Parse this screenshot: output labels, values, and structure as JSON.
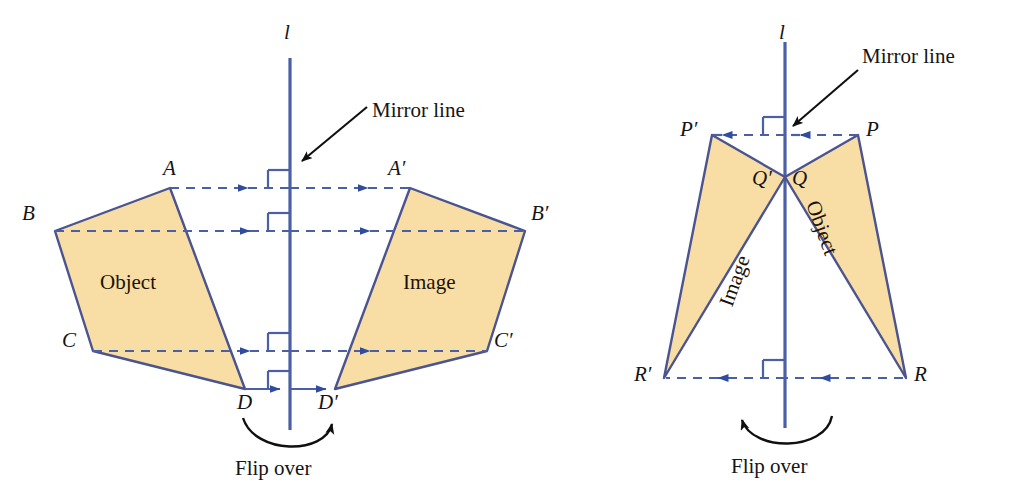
{
  "figure": {
    "type": "geometry-diagram",
    "topic": "Reflection across a mirror line",
    "panels": [
      {
        "id": "left",
        "mirror_line_label": "l",
        "mirror_line_annotation": "Mirror line",
        "flip_label": "Flip over",
        "object_label": "Object",
        "image_label": "Image",
        "object_vertices": [
          "A",
          "B",
          "C",
          "D"
        ],
        "image_vertices": [
          "A′",
          "B′",
          "C′",
          "D′"
        ],
        "vertex_labels": {
          "A": "A",
          "B": "B",
          "C": "C",
          "D": "D",
          "Ap": "A′",
          "Bp": "B′",
          "Cp": "C′",
          "Dp": "D′"
        },
        "connector_count": 4,
        "right_angle_marks": 4
      },
      {
        "id": "right",
        "mirror_line_label": "l",
        "mirror_line_annotation": "Mirror line",
        "flip_label": "Flip over",
        "object_label": "Object",
        "image_label": "Image",
        "object_vertices": [
          "P",
          "Q",
          "R"
        ],
        "image_vertices": [
          "P′",
          "Q′",
          "R′"
        ],
        "vertex_labels": {
          "P": "P",
          "Q": "Q",
          "R": "R",
          "Pp": "P′",
          "Qp": "Q′",
          "Rp": "R′"
        },
        "connector_count": 2,
        "right_angle_marks": 2
      }
    ],
    "colors": {
      "shape_fill": "#f8dda4",
      "shape_stroke": "#4a5490",
      "mirror_line": "#4a5fa5",
      "dashed_connector": "#4a5fa5",
      "arrow_head": "#2f4c9e",
      "annotation_arrow": "#101010",
      "label_text": "#151515",
      "background": "#ffffff"
    }
  }
}
